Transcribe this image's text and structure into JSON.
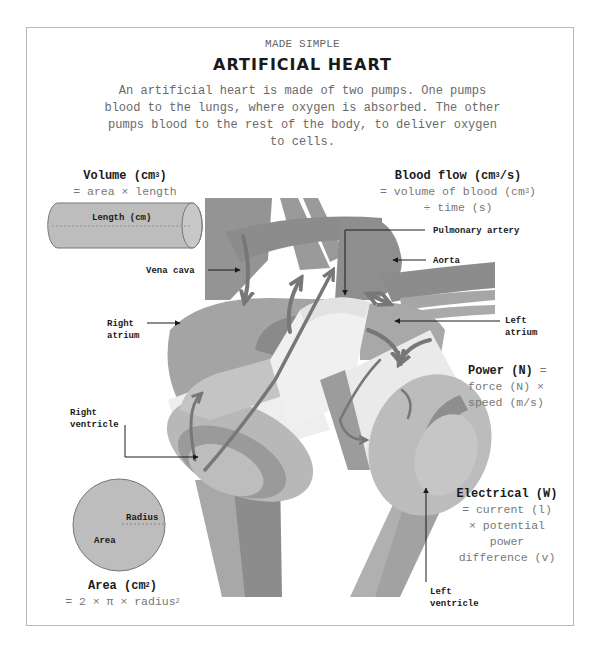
{
  "header": {
    "kicker": "MADE SIMPLE",
    "title": "ARTIFICIAL HEART",
    "intro": "An artificial heart is made of two pumps. One pumps blood to the lungs, where oxygen is absorbed. The other pumps blood to the rest of the body, to deliver oxygen to cells."
  },
  "formulas": {
    "volume": {
      "heading": "Volume (cm",
      "heading_sup": "3",
      "heading_end": ")",
      "line1": "= area × length",
      "cylinder_label": "Length (cm)"
    },
    "blood_flow": {
      "heading": "Blood flow (cm",
      "heading_sup": "3",
      "heading_end": "/s)",
      "line1": "= volume of blood (cm",
      "line1_sup": "3",
      "line1_end": ")",
      "line2": "÷ time (s)"
    },
    "power": {
      "heading": "Power (N)",
      "heading_tail": " =",
      "line1": "force (N) ×",
      "line2": "speed (m/s)"
    },
    "electrical": {
      "heading": "Electrical (W)",
      "line1": "= current (l)",
      "line2": "× potential",
      "line3": "power",
      "line4": "difference (v)"
    },
    "area": {
      "heading": "Area (cm",
      "heading_sup": "2",
      "heading_end": ")",
      "line1": "= 2 × π × radius",
      "line1_sup": "2",
      "circle_radius_label": "Radius",
      "circle_area_label": "Area"
    }
  },
  "labels": {
    "vena_cava": "Vena cava",
    "right_atrium_1": "Right",
    "right_atrium_2": "atrium",
    "right_ventricle_1": "Right",
    "right_ventricle_2": "ventricle",
    "pulmonary_artery": "Pulmonary artery",
    "aorta": "Aorta",
    "left_atrium_1": "Left",
    "left_atrium_2": "atrium",
    "left_ventricle_1": "Left",
    "left_ventricle_2": "ventricle"
  },
  "colors": {
    "border": "#b8b8b8",
    "tissue_dark": "#8a8a8a",
    "tissue_mid": "#9e9e9e",
    "tissue_light": "#b4b4b4",
    "pump_band": "#eeeeee",
    "arrow": "#6e6e6e",
    "text_dark": "#1a1a1a",
    "text_muted": "#777777"
  }
}
